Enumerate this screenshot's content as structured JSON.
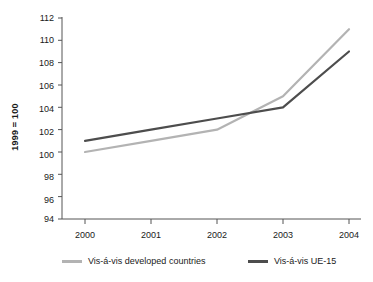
{
  "chart_data": {
    "type": "line",
    "title": "",
    "subtitle": "",
    "xlabel": "",
    "ylabel": "1999 = 100",
    "categories": [
      "2000",
      "2001",
      "2002",
      "2003",
      "2004"
    ],
    "x": [
      2000,
      2001,
      2002,
      2003,
      2004
    ],
    "series": [
      {
        "name": "Vis-á-vis developed countries",
        "color": "#b3b3b3",
        "values": [
          100,
          101,
          102,
          105,
          111
        ]
      },
      {
        "name": "Vis-á-vis UE-15",
        "color": "#4d4d4d",
        "values": [
          101,
          102,
          103,
          104,
          109
        ]
      }
    ],
    "ylim": [
      94,
      112
    ],
    "yticks": [
      94,
      96,
      98,
      100,
      102,
      104,
      106,
      108,
      110,
      112
    ],
    "ytick_labels": [
      "94",
      "96",
      "98",
      "100",
      "102",
      "104",
      "106",
      "108",
      "110",
      "112"
    ],
    "xtick_labels": [
      "2000",
      "2001",
      "2002",
      "2003",
      "2004"
    ],
    "grid": false,
    "legend_position": "bottom"
  },
  "legend": {
    "items": [
      {
        "label": "Vis-á-vis developed countries",
        "color": "#b3b3b3"
      },
      {
        "label": "Vis-á-vis UE-15",
        "color": "#4d4d4d"
      }
    ]
  },
  "axes": {
    "y_title": "1999 = 100",
    "y_labels": [
      "112",
      "110",
      "108",
      "106",
      "104",
      "102",
      "100",
      "98",
      "96",
      "94"
    ],
    "x_labels": [
      "2000",
      "2001",
      "2002",
      "2003",
      "2004"
    ]
  },
  "colors": {
    "series_light": "#b3b3b3",
    "series_dark": "#4d4d4d",
    "axis": "#555555",
    "text": "#1a1a1a",
    "background": "#ffffff"
  }
}
